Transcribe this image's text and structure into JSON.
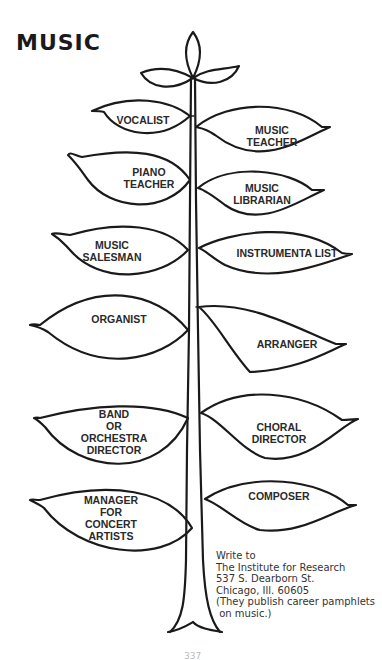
{
  "title": "MUSIC",
  "diagram": {
    "type": "career-tree",
    "colors": {
      "ink": "#1a1a1a",
      "background": "#ffffff"
    },
    "leaves": [
      {
        "side": "left",
        "lines": [
          "VOCALIST"
        ],
        "cx": 167,
        "cy": 120
      },
      {
        "side": "right",
        "lines": [
          "MUSIC",
          "TEACHER"
        ],
        "cx": 272,
        "cy": 136
      },
      {
        "side": "left",
        "lines": [
          "PIANO",
          "TEACHER"
        ],
        "cx": 149,
        "cy": 178
      },
      {
        "side": "right",
        "lines": [
          "MUSIC",
          "LIBRARIAN"
        ],
        "cx": 262,
        "cy": 194
      },
      {
        "side": "left",
        "lines": [
          "MUSIC",
          "SALESMAN"
        ],
        "cx": 112,
        "cy": 251
      },
      {
        "side": "right",
        "lines": [
          "INSTRUMENTA LIST"
        ],
        "cx": 287,
        "cy": 253
      },
      {
        "side": "left",
        "lines": [
          "ORGANIST"
        ],
        "cx": 119,
        "cy": 319
      },
      {
        "side": "right",
        "lines": [
          "ARRANGER"
        ],
        "cx": 287,
        "cy": 344
      },
      {
        "side": "left",
        "lines": [
          "BAND",
          "OR",
          "ORCHESTRA",
          "DIRECTOR"
        ],
        "cx": 114,
        "cy": 428
      },
      {
        "side": "right",
        "lines": [
          "CHORAL",
          "DIRECTOR"
        ],
        "cx": 279,
        "cy": 433
      },
      {
        "side": "left",
        "lines": [
          "MANAGER",
          "FOR",
          "CONCERT",
          "ARTISTS"
        ],
        "cx": 111,
        "cy": 516
      },
      {
        "side": "right",
        "lines": [
          "COMPOSER"
        ],
        "cx": 279,
        "cy": 496
      }
    ]
  },
  "note": {
    "lines": [
      "Write to",
      "The Institute for Research",
      "537 S. Dearborn St.",
      "Chicago, Ill. 60605",
      "(They publish career pamphlets",
      " on music.)"
    ]
  },
  "page_number": "337"
}
